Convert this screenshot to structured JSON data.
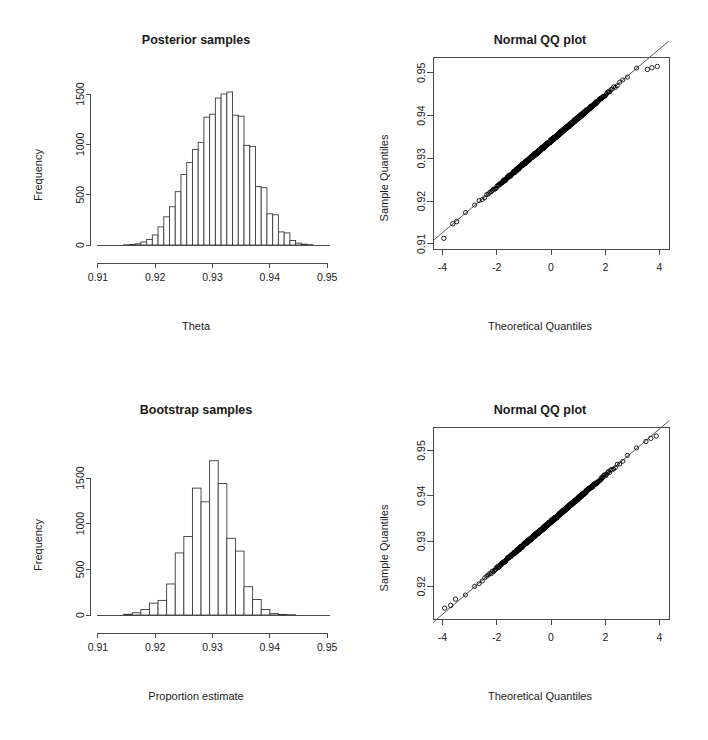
{
  "figure": {
    "background": "#ffffff",
    "foreground": "#1a1a1a",
    "layout": "2 rows x 2 columns"
  },
  "panels": {
    "posterior_hist": {
      "title": "Posterior samples",
      "xlabel": "Theta",
      "ylabel": "Frequency"
    },
    "posterior_qq": {
      "title": "Normal QQ plot",
      "xlabel": "Theoretical Quantiles",
      "ylabel": "Sample Quantiles"
    },
    "bootstrap_hist": {
      "title": "Bootstrap samples",
      "xlabel": "Proportion estimate",
      "ylabel": "Frequency"
    },
    "bootstrap_qq": {
      "title": "Normal QQ plot",
      "xlabel": "Theoretical Quantiles",
      "ylabel": "Sample Quantiles"
    }
  },
  "chart_data": [
    {
      "id": "posterior_hist",
      "type": "bar",
      "title": "Posterior samples",
      "xlabel": "Theta",
      "ylabel": "Frequency",
      "xlim": [
        0.9095,
        0.9505
      ],
      "ylim": [
        0,
        1560
      ],
      "xticks": [
        0.91,
        0.92,
        0.93,
        0.94,
        0.95
      ],
      "xtick_labels": [
        "0.91",
        "0.92",
        "0.93",
        "0.94",
        "0.95"
      ],
      "yticks": [
        0,
        500,
        1000,
        1500
      ],
      "ytick_labels": [
        "0",
        "500",
        "1000",
        "1500"
      ],
      "grid": false,
      "legend": "none",
      "bin_width": 0.001,
      "bin_edges": [
        0.9145,
        0.9155,
        0.9165,
        0.9175,
        0.9185,
        0.9195,
        0.9205,
        0.9215,
        0.9225,
        0.9235,
        0.9245,
        0.9255,
        0.9265,
        0.9275,
        0.9285,
        0.9295,
        0.9305,
        0.9315,
        0.9325,
        0.9335,
        0.9345,
        0.9355,
        0.9365,
        0.9375,
        0.9385,
        0.9395,
        0.9405,
        0.9415,
        0.9425,
        0.9435,
        0.9445,
        0.9455,
        0.9465,
        0.9475
      ],
      "categories": [
        "0.9150",
        "0.9160",
        "0.9170",
        "0.9180",
        "0.9190",
        "0.9200",
        "0.9210",
        "0.9220",
        "0.9230",
        "0.9240",
        "0.9250",
        "0.9260",
        "0.9270",
        "0.9280",
        "0.9290",
        "0.9300",
        "0.9310",
        "0.9320",
        "0.9330",
        "0.9340",
        "0.9350",
        "0.9360",
        "0.9370",
        "0.9380",
        "0.9390",
        "0.9400",
        "0.9410",
        "0.9420",
        "0.9430",
        "0.9440",
        "0.9450",
        "0.9460",
        "0.9470"
      ],
      "values": [
        2,
        5,
        12,
        30,
        55,
        100,
        180,
        280,
        380,
        530,
        700,
        820,
        950,
        1020,
        1270,
        1300,
        1460,
        1500,
        1520,
        1290,
        1280,
        990,
        980,
        580,
        570,
        310,
        300,
        130,
        120,
        45,
        18,
        8,
        3
      ]
    },
    {
      "id": "posterior_qq",
      "type": "scatter",
      "title": "Normal QQ plot",
      "xlabel": "Theoretical Quantiles",
      "ylabel": "Sample Quantiles",
      "xlim": [
        -4.35,
        4.35
      ],
      "ylim": [
        0.9088,
        0.9537
      ],
      "xticks": [
        -4,
        -2,
        0,
        2,
        4
      ],
      "xtick_labels": [
        "-4",
        "-2",
        "0",
        "2",
        "4"
      ],
      "yticks": [
        0.91,
        0.92,
        0.93,
        0.94,
        0.95
      ],
      "ytick_labels": [
        "0.91",
        "0.92",
        "0.93",
        "0.94",
        "0.95"
      ],
      "grid": false,
      "legend": "none",
      "box": true,
      "n_points": 10000,
      "reference_line": {
        "intercept": 0.9341,
        "slope": 0.00537
      },
      "center": 0.9341,
      "sd": 0.00537,
      "tail_outliers_low": [
        {
          "x": -3.95,
          "y": 0.9113
        },
        {
          "x": -3.62,
          "y": 0.9147
        },
        {
          "x": -3.48,
          "y": 0.9152
        }
      ],
      "tail_outliers_high": [
        {
          "x": 3.55,
          "y": 0.9508
        },
        {
          "x": 3.72,
          "y": 0.9512
        },
        {
          "x": 3.92,
          "y": 0.9515
        }
      ]
    },
    {
      "id": "bootstrap_hist",
      "type": "bar",
      "title": "Bootstrap samples",
      "xlabel": "Proportion estimate",
      "ylabel": "Frequency",
      "xlim": [
        0.9095,
        0.9505
      ],
      "ylim": [
        0,
        1720
      ],
      "xticks": [
        0.91,
        0.92,
        0.93,
        0.94,
        0.95
      ],
      "xtick_labels": [
        "0.91",
        "0.92",
        "0.93",
        "0.94",
        "0.95"
      ],
      "yticks": [
        0,
        500,
        1000,
        1500
      ],
      "ytick_labels": [
        "0",
        "500",
        "1000",
        "1500"
      ],
      "grid": false,
      "legend": "none",
      "bin_width": 0.0015,
      "bin_edges": [
        0.9145,
        0.916,
        0.9175,
        0.919,
        0.9205,
        0.922,
        0.9235,
        0.925,
        0.9265,
        0.928,
        0.9295,
        0.931,
        0.9325,
        0.934,
        0.9355,
        0.937,
        0.9385,
        0.94,
        0.9415,
        0.943,
        0.9445,
        0.946,
        0.9475
      ],
      "categories": [
        "0.9152",
        "0.9168",
        "0.9182",
        "0.9198",
        "0.9212",
        "0.9228",
        "0.9242",
        "0.9258",
        "0.9272",
        "0.9288",
        "0.9302",
        "0.9318",
        "0.9332",
        "0.9348",
        "0.9362",
        "0.9378",
        "0.9392",
        "0.9408",
        "0.9422",
        "0.9438",
        "0.9452",
        "0.9468"
      ],
      "values": [
        8,
        25,
        60,
        130,
        160,
        340,
        680,
        860,
        1390,
        1240,
        1690,
        1440,
        840,
        700,
        310,
        170,
        60,
        15,
        6,
        3,
        2,
        1
      ]
    },
    {
      "id": "bootstrap_qq",
      "type": "scatter",
      "title": "Normal QQ plot",
      "xlabel": "Theoretical Quantiles",
      "ylabel": "Sample Quantiles",
      "xlim": [
        -4.35,
        4.35
      ],
      "ylim": [
        0.9128,
        0.9552
      ],
      "xticks": [
        -4,
        -2,
        0,
        2,
        4
      ],
      "xtick_labels": [
        "-4",
        "-2",
        "0",
        "2",
        "4"
      ],
      "yticks": [
        0.92,
        0.93,
        0.94,
        0.95
      ],
      "ytick_labels": [
        "0.92",
        "0.93",
        "0.94",
        "0.95"
      ],
      "grid": false,
      "legend": "none",
      "box": true,
      "n_points": 10000,
      "reference_line": {
        "intercept": 0.9343,
        "slope": 0.00512
      },
      "center": 0.9343,
      "sd": 0.00512,
      "tail_outliers_low": [
        {
          "x": -3.92,
          "y": 0.9152
        },
        {
          "x": -3.7,
          "y": 0.9158
        },
        {
          "x": -3.52,
          "y": 0.9172
        }
      ],
      "tail_outliers_high": [
        {
          "x": 3.5,
          "y": 0.952
        },
        {
          "x": 3.68,
          "y": 0.9527
        },
        {
          "x": 3.88,
          "y": 0.9532
        }
      ]
    }
  ]
}
